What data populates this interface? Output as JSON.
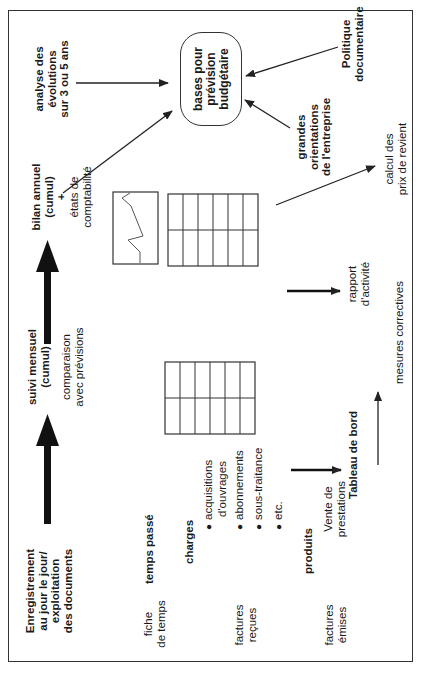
{
  "diagram": {
    "orientation": "rotated-90-ccw",
    "stages": {
      "enregistrement": [
        "Enregistrement",
        "au jour le jour/",
        "exploitation",
        "des documents"
      ],
      "suivi_mensuel": [
        "suivi mensuel",
        "(cumul)"
      ],
      "comparaison": [
        "comparaison",
        "avec prévisions"
      ],
      "bilan_annuel": [
        "bilan annuel",
        "(cumul)",
        "+"
      ],
      "etats": [
        "états de",
        "comptabilité"
      ],
      "analyse": [
        "analyse des",
        "évolutions",
        "sur 3 ou 5 ans"
      ],
      "bases": [
        "bases pour",
        "prévision",
        "budgétaire"
      ],
      "grandes_orientations": [
        "grandes",
        "orientations",
        "de l'entreprise"
      ],
      "politique": [
        "Politique",
        "documentaire"
      ]
    },
    "sources": {
      "fiche_temps": [
        "fiche",
        "de temps"
      ],
      "temps_passe": "temps passé",
      "factures_recues": [
        "factures",
        "reçues"
      ],
      "charges": "charges",
      "charges_items": [
        "acquisitions d'ouvrages",
        "abonnements",
        "sous-traitance",
        "etc."
      ],
      "charges_item_lines": {
        "acq1": "acquisitions",
        "acq2": "d'ouvrages"
      },
      "factures_emises": [
        "factures",
        "émises"
      ],
      "produits": "produits",
      "vente": [
        "Vente de",
        "prestations"
      ]
    },
    "outputs": {
      "tableau_de_bord": "Tableau de bord",
      "mesures_correctives": "mesures correctives",
      "rapport": [
        "rapport",
        "d'activité"
      ],
      "calcul": [
        "calcul des",
        "prix de revient"
      ]
    },
    "colors": {
      "line": "#333333",
      "text": "#1a1a1a",
      "background": "#ffffff"
    }
  }
}
